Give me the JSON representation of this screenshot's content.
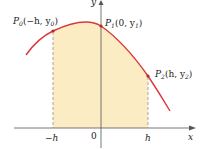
{
  "diagram": {
    "type": "function-graph-simpson-parabola",
    "colors": {
      "curve": "#d8393a",
      "shade": "#fbecc4",
      "axis": "#555555",
      "dashed": "#9a8f8f",
      "text": "#222222"
    },
    "axes": {
      "x_label": "x",
      "y_label": "y"
    },
    "ticks": {
      "neg_h": "−h",
      "zero": "0",
      "pos_h": "h"
    },
    "points": [
      {
        "name": "P0",
        "base": "P",
        "sub": "0",
        "coords_text": "(−h, y",
        "coords_sub": "0",
        "coords_end": ")"
      },
      {
        "name": "P1",
        "base": "P",
        "sub": "1",
        "coords_text": "(0, y",
        "coords_sub": "1",
        "coords_end": ")"
      },
      {
        "name": "P2",
        "base": "P",
        "sub": "2",
        "coords_text": "(h, y",
        "coords_sub": "2",
        "coords_end": ")"
      }
    ]
  }
}
